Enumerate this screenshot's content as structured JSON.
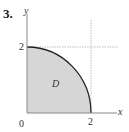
{
  "problem": {
    "number": "3."
  },
  "diagram": {
    "axis_labels": {
      "x": "x",
      "y": "y"
    },
    "ticks": {
      "origin": "0",
      "x_tick": "2",
      "y_tick": "2"
    },
    "region_label": "D",
    "region": "quarter disk of radius 2 in first quadrant",
    "colors": {
      "fill": "#d6d6d6",
      "curve": "#222222",
      "axis": "#888888",
      "guide": "#aaaaaa"
    }
  }
}
